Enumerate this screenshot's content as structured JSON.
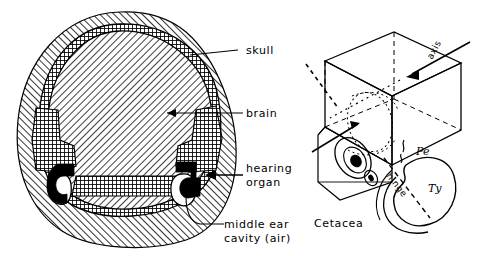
{
  "figure": {
    "background": "#ffffff",
    "ink": "#000000",
    "panels": [
      {
        "id": "left",
        "name": "skull-cross-section",
        "labels": [
          {
            "id": "skull",
            "text": "skull",
            "leader": "line"
          },
          {
            "id": "brain",
            "text": "brain",
            "leader": "arrow"
          },
          {
            "id": "hearing_organ_1",
            "text": "hearing",
            "leader": "arrow"
          },
          {
            "id": "hearing_organ_2",
            "text": "organ",
            "leader": "none"
          },
          {
            "id": "middle_ear_1",
            "text": "middle ear",
            "leader": "line"
          },
          {
            "id": "middle_ear_2",
            "text": "cavity (air)",
            "leader": "none"
          }
        ],
        "regions": [
          {
            "id": "skull_bone",
            "fill": "hatch-fwd",
            "meaning": "skull"
          },
          {
            "id": "brain_mass",
            "fill": "hatch-back",
            "meaning": "brain"
          },
          {
            "id": "bone_capsule",
            "fill": "crosshatch",
            "meaning": "dense bone"
          },
          {
            "id": "ear_bone",
            "fill": "solid-black",
            "meaning": "hearing organ"
          },
          {
            "id": "air_cavity",
            "fill": "white",
            "meaning": "middle ear cavity (air)"
          }
        ]
      },
      {
        "id": "right",
        "name": "cetacea-3d-diagram",
        "caption": "Cetacea",
        "labels": [
          {
            "id": "axis",
            "text": "axis",
            "rotated": true
          },
          {
            "id": "hinge",
            "text": "hinge",
            "rotated": true
          },
          {
            "id": "pe",
            "text": "Pe",
            "meaning": "periotic"
          },
          {
            "id": "ty",
            "text": "Ty",
            "meaning": "tympanic"
          }
        ]
      }
    ]
  }
}
